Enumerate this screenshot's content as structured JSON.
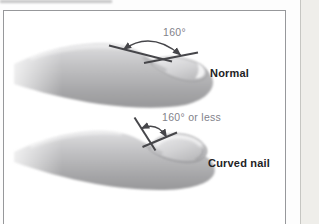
{
  "figure": {
    "panels": [
      {
        "angle_label": "160°",
        "caption": "Normal"
      },
      {
        "angle_label": "160° or less",
        "caption": "Curved nail"
      }
    ]
  },
  "colors": {
    "finger_light": "#dedee0",
    "finger_mid": "#bcbcbe",
    "finger_dark": "#98989a",
    "nail_light": "#eeeef0",
    "nail_dark": "#b9b9bb",
    "annotation_line": "#46464a",
    "angle_text": "#82828a",
    "caption_text": "#232325",
    "box_border": "#97989b",
    "page_edge_strip": "#efeeea"
  }
}
